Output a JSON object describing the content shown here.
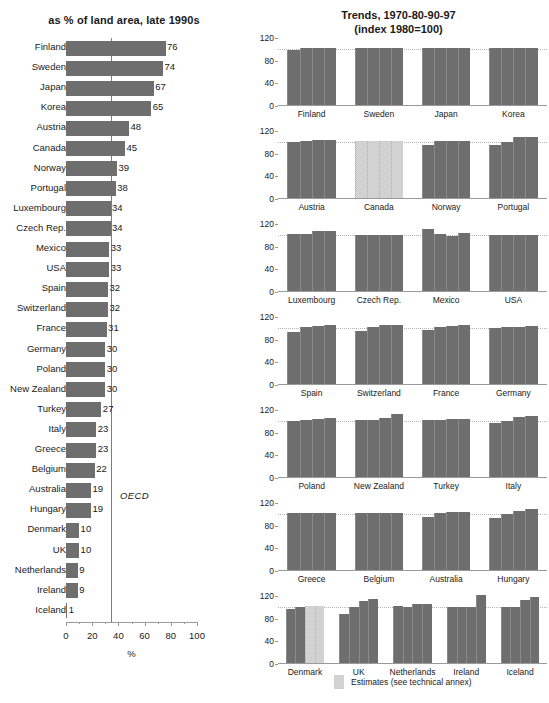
{
  "left_chart": {
    "title": "as % of land area, late 1990s",
    "xlabel": "%",
    "reference_label": "OECD",
    "xticks": [
      "0",
      "20",
      "40",
      "60",
      "80",
      "100"
    ]
  },
  "right_chart": {
    "title_line1": "Trends, 1970-80-90-97",
    "title_line2": "(index 1980=100)",
    "yticks": [
      "0",
      "40",
      "80",
      "120"
    ],
    "legend_label": "Estimates (see technical annex)"
  },
  "chart_data": [
    {
      "type": "bar",
      "orientation": "horizontal",
      "title": "as % of land area, late 1990s",
      "xlabel": "%",
      "ylabel": "",
      "xlim": [
        0,
        100
      ],
      "xticks": [
        0,
        20,
        40,
        60,
        80,
        100
      ],
      "grid": false,
      "reference_line": {
        "label": "OECD",
        "value": 34
      },
      "categories": [
        "Finland",
        "Sweden",
        "Japan",
        "Korea",
        "Austria",
        "Canada",
        "Norway",
        "Portugal",
        "Luxembourg",
        "Czech Rep.",
        "Mexico",
        "USA",
        "Spain",
        "Switzerland",
        "France",
        "Germany",
        "Poland",
        "New Zealand",
        "Turkey",
        "Italy",
        "Greece",
        "Belgium",
        "Australia",
        "Hungary",
        "Denmark",
        "UK",
        "Netherlands",
        "Ireland",
        "Iceland"
      ],
      "values": [
        76,
        74,
        67,
        65,
        48,
        45,
        39,
        38,
        34,
        34,
        33,
        33,
        32,
        32,
        31,
        30,
        30,
        30,
        27,
        23,
        23,
        22,
        19,
        19,
        10,
        10,
        9,
        9,
        1
      ]
    },
    {
      "type": "bar",
      "orientation": "vertical",
      "title": "Trends, 1970-80-90-97 (index 1980=100)",
      "ylabel": "",
      "ylim": [
        0,
        120
      ],
      "yticks": [
        0,
        40,
        80,
        120
      ],
      "grid": false,
      "series_names": [
        "1970",
        "1980",
        "1990",
        "1997"
      ],
      "reference_value": 100,
      "legend": "Estimates (see technical annex)",
      "groups": [
        {
          "name": "Finland",
          "values": [
            97,
            100,
            100,
            100
          ],
          "estimate": false
        },
        {
          "name": "Sweden",
          "values": [
            100,
            100,
            100,
            100
          ],
          "estimate": false
        },
        {
          "name": "Japan",
          "values": [
            100,
            100,
            100,
            100
          ],
          "estimate": false
        },
        {
          "name": "Korea",
          "values": [
            100,
            100,
            100,
            100
          ],
          "estimate": false
        },
        {
          "name": "Austria",
          "values": [
            98,
            100,
            102,
            103
          ],
          "estimate": false
        },
        {
          "name": "Canada",
          "values": [
            100,
            100,
            100,
            100
          ],
          "estimate": true
        },
        {
          "name": "Norway",
          "values": [
            94,
            100,
            100,
            100
          ],
          "estimate": false
        },
        {
          "name": "Portugal",
          "values": [
            93,
            98,
            107,
            107
          ],
          "estimate": false
        },
        {
          "name": "Luxembourg",
          "values": [
            100,
            100,
            106,
            106
          ],
          "estimate": false
        },
        {
          "name": "Czech Rep.",
          "values": [
            99,
            99,
            99,
            99
          ],
          "estimate": false
        },
        {
          "name": "Mexico",
          "values": [
            110,
            100,
            97,
            102
          ],
          "estimate": false
        },
        {
          "name": "USA",
          "values": [
            98,
            98,
            98,
            98
          ],
          "estimate": false
        },
        {
          "name": "Spain",
          "values": [
            92,
            100,
            103,
            104
          ],
          "estimate": false
        },
        {
          "name": "Switzerland",
          "values": [
            93,
            101,
            104,
            104
          ],
          "estimate": false
        },
        {
          "name": "France",
          "values": [
            96,
            100,
            102,
            104
          ],
          "estimate": false
        },
        {
          "name": "Germany",
          "values": [
            99,
            100,
            101,
            103
          ],
          "estimate": false
        },
        {
          "name": "Poland",
          "values": [
            99,
            101,
            103,
            104
          ],
          "estimate": false
        },
        {
          "name": "New Zealand",
          "values": [
            101,
            100,
            105,
            112
          ],
          "estimate": false
        },
        {
          "name": "Turkey",
          "values": [
            101,
            101,
            102,
            102
          ],
          "estimate": false
        },
        {
          "name": "Italy",
          "values": [
            95,
            99,
            106,
            107
          ],
          "estimate": false
        },
        {
          "name": "Greece",
          "values": [
            100,
            100,
            100,
            100
          ],
          "estimate": false
        },
        {
          "name": "Belgium",
          "values": [
            101,
            101,
            101,
            101
          ],
          "estimate": false
        },
        {
          "name": "Australia",
          "values": [
            94,
            100,
            102,
            102
          ],
          "estimate": false
        },
        {
          "name": "Hungary",
          "values": [
            92,
            99,
            105,
            108
          ],
          "estimate": false
        },
        {
          "name": "Denmark",
          "values": [
            95,
            99,
            100,
            100
          ],
          "estimate": "partial",
          "estimate_from": 2
        },
        {
          "name": "UK",
          "values": [
            87,
            99,
            109,
            113
          ],
          "estimate": false
        },
        {
          "name": "Netherlands",
          "values": [
            100,
            99,
            104,
            105
          ],
          "estimate": false
        },
        {
          "name": "Ireland",
          "values": [
            99,
            99,
            99,
            120
          ],
          "estimate": false
        },
        {
          "name": "Iceland",
          "values": [
            99,
            99,
            112,
            116
          ],
          "estimate": false
        }
      ],
      "rows": [
        [
          "Finland",
          "Sweden",
          "Japan",
          "Korea"
        ],
        [
          "Austria",
          "Canada",
          "Norway",
          "Portugal"
        ],
        [
          "Luxembourg",
          "Czech Rep.",
          "Mexico",
          "USA"
        ],
        [
          "Spain",
          "Switzerland",
          "France",
          "Germany"
        ],
        [
          "Poland",
          "New Zealand",
          "Turkey",
          "Italy"
        ],
        [
          "Greece",
          "Belgium",
          "Australia",
          "Hungary"
        ],
        [
          "Denmark",
          "UK",
          "Netherlands",
          "Ireland",
          "Iceland"
        ]
      ]
    }
  ]
}
